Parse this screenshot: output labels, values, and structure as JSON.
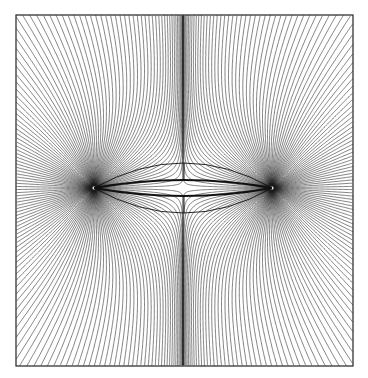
{
  "diagram": {
    "type": "field-lines",
    "frame": {
      "x": 16,
      "y": 15,
      "width": 337,
      "height": 351,
      "stroke": "#222222"
    },
    "sources": [
      {
        "name": "left-singularity",
        "x": 94,
        "y": 188
      },
      {
        "name": "right-singularity",
        "x": 272,
        "y": 188
      }
    ],
    "lines_per_source": 150,
    "line_color": "#1a1a1a",
    "lens": {
      "inner_bulge": 8,
      "outer_bulge": 25,
      "tick_x": 184
    }
  }
}
